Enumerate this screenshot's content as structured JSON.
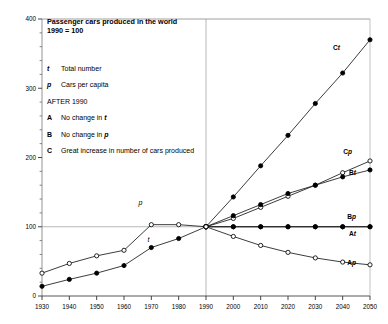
{
  "title": {
    "line1": "Passenger cars produced in the world",
    "line2": "1990 = 100"
  },
  "legend": {
    "entries": [
      {
        "key": "t",
        "key_style": "italic",
        "text": "Total number"
      },
      {
        "key": "p",
        "key_style": "italic",
        "text": "Cars per capita"
      },
      {
        "key": "",
        "key_style": "none",
        "text": "AFTER 1990"
      },
      {
        "key": "A",
        "key_style": "bold",
        "text": "No change in ",
        "text_italic_suffix": "t"
      },
      {
        "key": "B",
        "key_style": "bold",
        "text": "No change in ",
        "text_italic_suffix": "p"
      },
      {
        "key": "C",
        "key_style": "bold",
        "text": "Great increase in number of cars produced",
        "text_italic_suffix": ""
      }
    ]
  },
  "inline_labels": [
    {
      "name": "p",
      "x": 1966,
      "y": 132
    },
    {
      "name": "t",
      "x": 1969,
      "y": 78
    }
  ],
  "curve_labels": [
    {
      "id": "Ct",
      "prefix": "C",
      "suffix": "t"
    },
    {
      "id": "Cp",
      "prefix": "C",
      "suffix": "p"
    },
    {
      "id": "Bt",
      "prefix": "B",
      "suffix": "t"
    },
    {
      "id": "Bp",
      "prefix": "B",
      "suffix": "p"
    },
    {
      "id": "At",
      "prefix": "A",
      "suffix": "t"
    },
    {
      "id": "Ap",
      "prefix": "A",
      "suffix": "p"
    }
  ],
  "chart_data": {
    "type": "line",
    "xlabel": "",
    "ylabel": "",
    "xlim": [
      1930,
      2050
    ],
    "ylim": [
      0,
      400
    ],
    "ytick_major": [
      0,
      100,
      200,
      300,
      400
    ],
    "ytick_minor_step": 20,
    "xticks": [
      1930,
      1940,
      1950,
      1960,
      1970,
      1980,
      1990,
      2000,
      2010,
      2020,
      2030,
      2040,
      2050
    ],
    "xtick_labels": [
      "1930",
      "1940",
      "1950",
      "1960",
      "1970",
      "1980",
      "1990",
      "2000",
      "2010",
      "2020",
      "2030",
      "2040",
      "2050"
    ],
    "ytick_labels": [
      "0",
      "100",
      "200",
      "300",
      "400"
    ],
    "grid": {
      "horizontal_at": [
        100
      ],
      "vertical_at": [
        1990
      ]
    },
    "legend_position": "inside-top-left",
    "marker_legend": {
      "filled-circle": "t (total number)",
      "open-circle": "p (cars per capita)"
    },
    "series": [
      {
        "name": "t",
        "label": "t",
        "marker": "filled-circle",
        "period": "historical",
        "x": [
          1930,
          1940,
          1950,
          1960,
          1970,
          1980,
          1990
        ],
        "values": [
          14,
          24,
          33,
          44,
          70,
          83,
          100
        ]
      },
      {
        "name": "p",
        "label": "p",
        "marker": "open-circle",
        "period": "historical",
        "x": [
          1930,
          1940,
          1950,
          1960,
          1970,
          1980,
          1990
        ],
        "values": [
          33,
          47,
          58,
          66,
          103,
          103,
          100
        ]
      },
      {
        "name": "Ct",
        "label": "C t",
        "marker": "filled-circle",
        "period": "projection",
        "x": [
          1990,
          2000,
          2010,
          2020,
          2030,
          2040,
          2050
        ],
        "values": [
          100,
          143,
          188,
          232,
          278,
          322,
          370
        ]
      },
      {
        "name": "Cp",
        "label": "C p",
        "marker": "open-circle",
        "period": "projection",
        "x": [
          1990,
          2000,
          2010,
          2020,
          2030,
          2040,
          2050
        ],
        "values": [
          100,
          112,
          128,
          144,
          160,
          178,
          195
        ]
      },
      {
        "name": "Bt",
        "label": "B t",
        "marker": "filled-circle",
        "period": "projection",
        "x": [
          1990,
          2000,
          2010,
          2020,
          2030,
          2040,
          2050
        ],
        "values": [
          100,
          116,
          132,
          148,
          160,
          172,
          182
        ]
      },
      {
        "name": "Bp",
        "label": "B p",
        "marker": "filled-circle",
        "period": "projection",
        "x": [
          1990,
          2000,
          2010,
          2020,
          2030,
          2040,
          2050
        ],
        "values": [
          100,
          100,
          100,
          100,
          100,
          100,
          100
        ]
      },
      {
        "name": "At",
        "label": "A t",
        "marker": "filled-circle",
        "period": "projection",
        "x": [
          1990,
          2000,
          2010,
          2020,
          2030,
          2040,
          2050
        ],
        "values": [
          100,
          100,
          100,
          100,
          100,
          100,
          100
        ]
      },
      {
        "name": "Ap",
        "label": "A p",
        "marker": "open-circle",
        "period": "projection",
        "x": [
          1990,
          2000,
          2010,
          2020,
          2030,
          2040,
          2050
        ],
        "values": [
          100,
          86,
          73,
          63,
          55,
          49,
          45
        ]
      }
    ]
  }
}
